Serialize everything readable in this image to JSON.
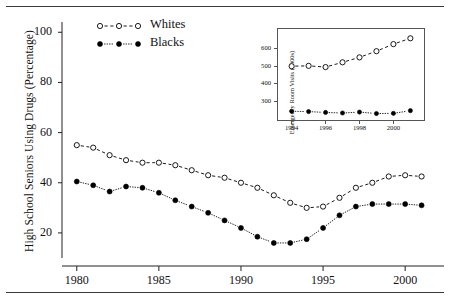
{
  "figure": {
    "has_top_rule": true,
    "has_bottom_rule": true,
    "background": "#ffffff",
    "ink": "#111111"
  },
  "chart_data": [
    {
      "id": "main",
      "type": "line",
      "title": "",
      "xlabel": "",
      "ylabel": "High School Seniors Using Drugs (Percentage)",
      "xlim": [
        1979,
        2002
      ],
      "ylim": [
        10,
        102
      ],
      "grid": false,
      "legend_position": "top-left-inside",
      "xticks": [
        1980,
        1985,
        1990,
        1995,
        2000
      ],
      "xticklabels": [
        "1980",
        "1985",
        "1990",
        "1995",
        "2000"
      ],
      "yticks": [
        20,
        40,
        60,
        80,
        100
      ],
      "yticklabels": [
        "20",
        "40",
        "60",
        "80",
        "100"
      ],
      "x": [
        1980,
        1981,
        1982,
        1983,
        1984,
        1985,
        1986,
        1987,
        1988,
        1989,
        1990,
        1991,
        1992,
        1993,
        1994,
        1995,
        1996,
        1997,
        1998,
        1999,
        2000,
        2001
      ],
      "series": [
        {
          "name": "Whites",
          "marker": "open-circle",
          "linestyle": "dashed",
          "color": "#000000",
          "values": [
            55.0,
            54.0,
            51.0,
            49.0,
            48.0,
            48.0,
            47.0,
            45.0,
            43.0,
            42.0,
            40.0,
            38.0,
            35.0,
            32.0,
            30.0,
            30.5,
            34.0,
            38.0,
            40.0,
            42.5,
            43.0,
            42.5
          ]
        },
        {
          "name": "Blacks",
          "marker": "filled-circle",
          "linestyle": "dotted",
          "color": "#000000",
          "values": [
            40.5,
            39.0,
            36.5,
            38.5,
            38.0,
            36.0,
            33.0,
            30.5,
            28.0,
            25.0,
            22.0,
            18.5,
            16.0,
            16.0,
            17.5,
            22.0,
            27.0,
            30.5,
            31.5,
            31.5,
            31.5,
            31.0
          ]
        }
      ]
    },
    {
      "id": "inset",
      "type": "line",
      "title": "",
      "xlabel": "",
      "ylabel": "Emergency Room Visits (1000s)",
      "xlim": [
        1993.5,
        2001.5
      ],
      "ylim": [
        215,
        690
      ],
      "grid": false,
      "framed": true,
      "xticks": [
        1994,
        1996,
        1998,
        2000
      ],
      "xticklabels": [
        "1994",
        "1996",
        "1998",
        "2000"
      ],
      "yticks": [
        300,
        400,
        500,
        600
      ],
      "yticklabels": [
        "300",
        "400",
        "500",
        "600"
      ],
      "x": [
        1994,
        1995,
        1996,
        1997,
        1998,
        1999,
        2000,
        2001
      ],
      "series": [
        {
          "name": "Whites",
          "marker": "open-circle",
          "linestyle": "dashed",
          "color": "#000000",
          "values": [
            500,
            502,
            495,
            522,
            550,
            585,
            625,
            658
          ]
        },
        {
          "name": "Blacks",
          "marker": "filled-circle",
          "linestyle": "dotted",
          "color": "#000000",
          "values": [
            245,
            243,
            238,
            235,
            240,
            232,
            233,
            248
          ]
        }
      ]
    }
  ],
  "legend": {
    "items": [
      {
        "label": "Whites",
        "marker": "open-circle",
        "linestyle": "dashed"
      },
      {
        "label": "Blacks",
        "marker": "filled-circle",
        "linestyle": "dotted"
      }
    ]
  }
}
